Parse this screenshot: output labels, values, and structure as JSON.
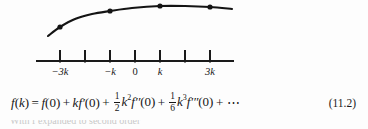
{
  "figure": {
    "name": "taylor-expansion-sampling-figure",
    "axis": {
      "line_color": "#1a1a1a",
      "x_start": 36,
      "x_end": 234,
      "y": 61,
      "tick_length": 11,
      "ticks": [
        {
          "x": 60,
          "label": "−3k",
          "labeled": true,
          "italic": true
        },
        {
          "x": 85,
          "label": "",
          "labeled": false,
          "italic": true
        },
        {
          "x": 110,
          "label": "−k",
          "labeled": true,
          "italic": true
        },
        {
          "x": 135,
          "label": "0",
          "labeled": true,
          "italic": false
        },
        {
          "x": 160,
          "label": "k",
          "labeled": true,
          "italic": true
        },
        {
          "x": 185,
          "label": "",
          "labeled": false,
          "italic": true
        },
        {
          "x": 210,
          "label": "3k",
          "labeled": true,
          "italic": true
        }
      ]
    },
    "curve": {
      "color": "#141414",
      "stroke_width": 2.1,
      "description": "smooth concave-down curve rising from lower left, peaking near k and flattening to the right",
      "path_points": [
        {
          "x": 48,
          "y": 36
        },
        {
          "x": 60,
          "y": 27
        },
        {
          "x": 75,
          "y": 19
        },
        {
          "x": 92,
          "y": 14
        },
        {
          "x": 110,
          "y": 11
        },
        {
          "x": 132,
          "y": 8
        },
        {
          "x": 160,
          "y": 6
        },
        {
          "x": 185,
          "y": 6
        },
        {
          "x": 210,
          "y": 7
        },
        {
          "x": 232,
          "y": 9
        }
      ],
      "markers": [
        {
          "x": 60,
          "y": 27,
          "label": "sample at -3k"
        },
        {
          "x": 110,
          "y": 11,
          "label": "sample at -k"
        },
        {
          "x": 160,
          "y": 6,
          "label": "sample at k"
        },
        {
          "x": 210,
          "y": 7,
          "label": "sample at 3k"
        }
      ],
      "marker_radius": 2.6
    }
  },
  "equation": {
    "number": "(11.2)",
    "plain_text": "f(k) = f(0) + kf'(0) + (1/2)k²f''(0) + (1/6)k³f'''(0) + ···",
    "lhs": {
      "fn": "f",
      "open": "(",
      "arg": "k",
      "close": ")"
    },
    "equals": "=",
    "terms": [
      {
        "id": "term-0",
        "coefficient": "",
        "fn": "f",
        "primes": "",
        "open": "(",
        "arg": "0",
        "close": ")"
      },
      {
        "id": "term-1",
        "coefficient": "k",
        "fn": "f",
        "primes": "′",
        "open": "(",
        "arg": "0",
        "close": ")"
      },
      {
        "id": "term-2",
        "frac_num": "1",
        "frac_den": "2",
        "base": "k",
        "power": "2",
        "fn": "f",
        "primes": "′′",
        "open": "(",
        "arg": "0",
        "close": ")"
      },
      {
        "id": "term-3",
        "frac_num": "1",
        "frac_den": "6",
        "base": "k",
        "power": "3",
        "fn": "f",
        "primes": "′′′",
        "open": "(",
        "arg": "0",
        "close": ")"
      }
    ],
    "plus": "+",
    "ellipsis": "⋯"
  },
  "cropped_bottom": {
    "text": "With f expanded to second order"
  }
}
